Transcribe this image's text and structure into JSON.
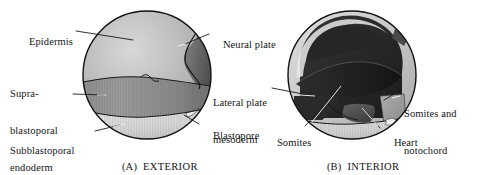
{
  "figure": {
    "kind": "biology-diagram",
    "background_color": "#ffffff",
    "panels": [
      {
        "id": "A",
        "caption_prefix": "(A)",
        "caption_text": "EXTERIOR",
        "regions": [
          {
            "name": "epidermis",
            "label": "Epidermis",
            "fill": "#b3b3b3"
          },
          {
            "name": "neural-plate",
            "label": "Neural plate",
            "fill": "#6e6e6e"
          },
          {
            "name": "suprablastoporal-endoderm",
            "label": "Supra-blastoporal endoderm",
            "fill": "#8a8a8a"
          },
          {
            "name": "subblastoporal-endoderm",
            "label": "Subblastoporal endoderm",
            "fill": "#dcdcdc"
          },
          {
            "name": "blastopore",
            "label": "Blastopore",
            "fill": "#cfcfcf"
          }
        ],
        "labels": [
          {
            "id": "epidermis",
            "lines": [
              "Epidermis"
            ],
            "x": 18,
            "y": 27,
            "align": "left"
          },
          {
            "id": "neural-plate",
            "lines": [
              "Neural plate"
            ],
            "x": 212,
            "y": 30,
            "align": "left"
          },
          {
            "id": "suprablastoporal-endoderm",
            "lines": [
              "Supra-",
              "blastoporal",
              "endoderm"
            ],
            "x": 10,
            "y": 67,
            "align": "left"
          },
          {
            "id": "subblastoporal-endoderm",
            "lines": [
              "Subblastoporal",
              "endoderm"
            ],
            "x": 10,
            "y": 123,
            "align": "left"
          },
          {
            "id": "blastopore",
            "lines": [
              "Blastopore"
            ],
            "x": 202,
            "y": 120,
            "align": "left"
          }
        ]
      },
      {
        "id": "B",
        "caption_prefix": "(B)",
        "caption_text": "INTERIOR",
        "regions": [
          {
            "name": "lateral-plate-mesoderm",
            "label": "Lateral plate mesoderm",
            "fill": "#2b2b2b"
          },
          {
            "name": "somites",
            "label": "Somites",
            "fill": "#3d3d3d"
          },
          {
            "name": "somites-and-notochord",
            "label": "Somites and notochord",
            "fill": "#9a9a9a"
          },
          {
            "name": "heart",
            "label": "Heart",
            "fill": "#555555"
          },
          {
            "name": "ectoderm-shell",
            "label": "ectoderm shell",
            "fill": "#c9c9c9"
          },
          {
            "name": "yolk-floor",
            "label": "yolk floor",
            "fill": "#d6d6d6"
          }
        ],
        "labels": [
          {
            "id": "lateral-plate-mesoderm",
            "lines": [
              "Lateral plate",
              "mesoderm"
            ],
            "x": 213,
            "y": 75,
            "align": "left"
          },
          {
            "id": "somites",
            "lines": [
              "Somites"
            ],
            "x": 266,
            "y": 128,
            "align": "left"
          },
          {
            "id": "somites-and-notochord",
            "lines": [
              "Somites and",
              "notochord"
            ],
            "x": 404,
            "y": 86,
            "align": "left"
          },
          {
            "id": "heart",
            "lines": [
              "Heart"
            ],
            "x": 383,
            "y": 128,
            "align": "left"
          }
        ]
      }
    ],
    "captions": [
      {
        "id": "caption-a",
        "prefix": "(A)",
        "text": "EXTERIOR",
        "x": 110,
        "y": 152
      },
      {
        "id": "caption-b",
        "prefix": "(B)",
        "text": "INTERIOR",
        "x": 315,
        "y": 152
      }
    ],
    "colors": {
      "outline": "#1a1a1a",
      "leader_line": "#1a1a1a",
      "text": "#141414"
    }
  }
}
